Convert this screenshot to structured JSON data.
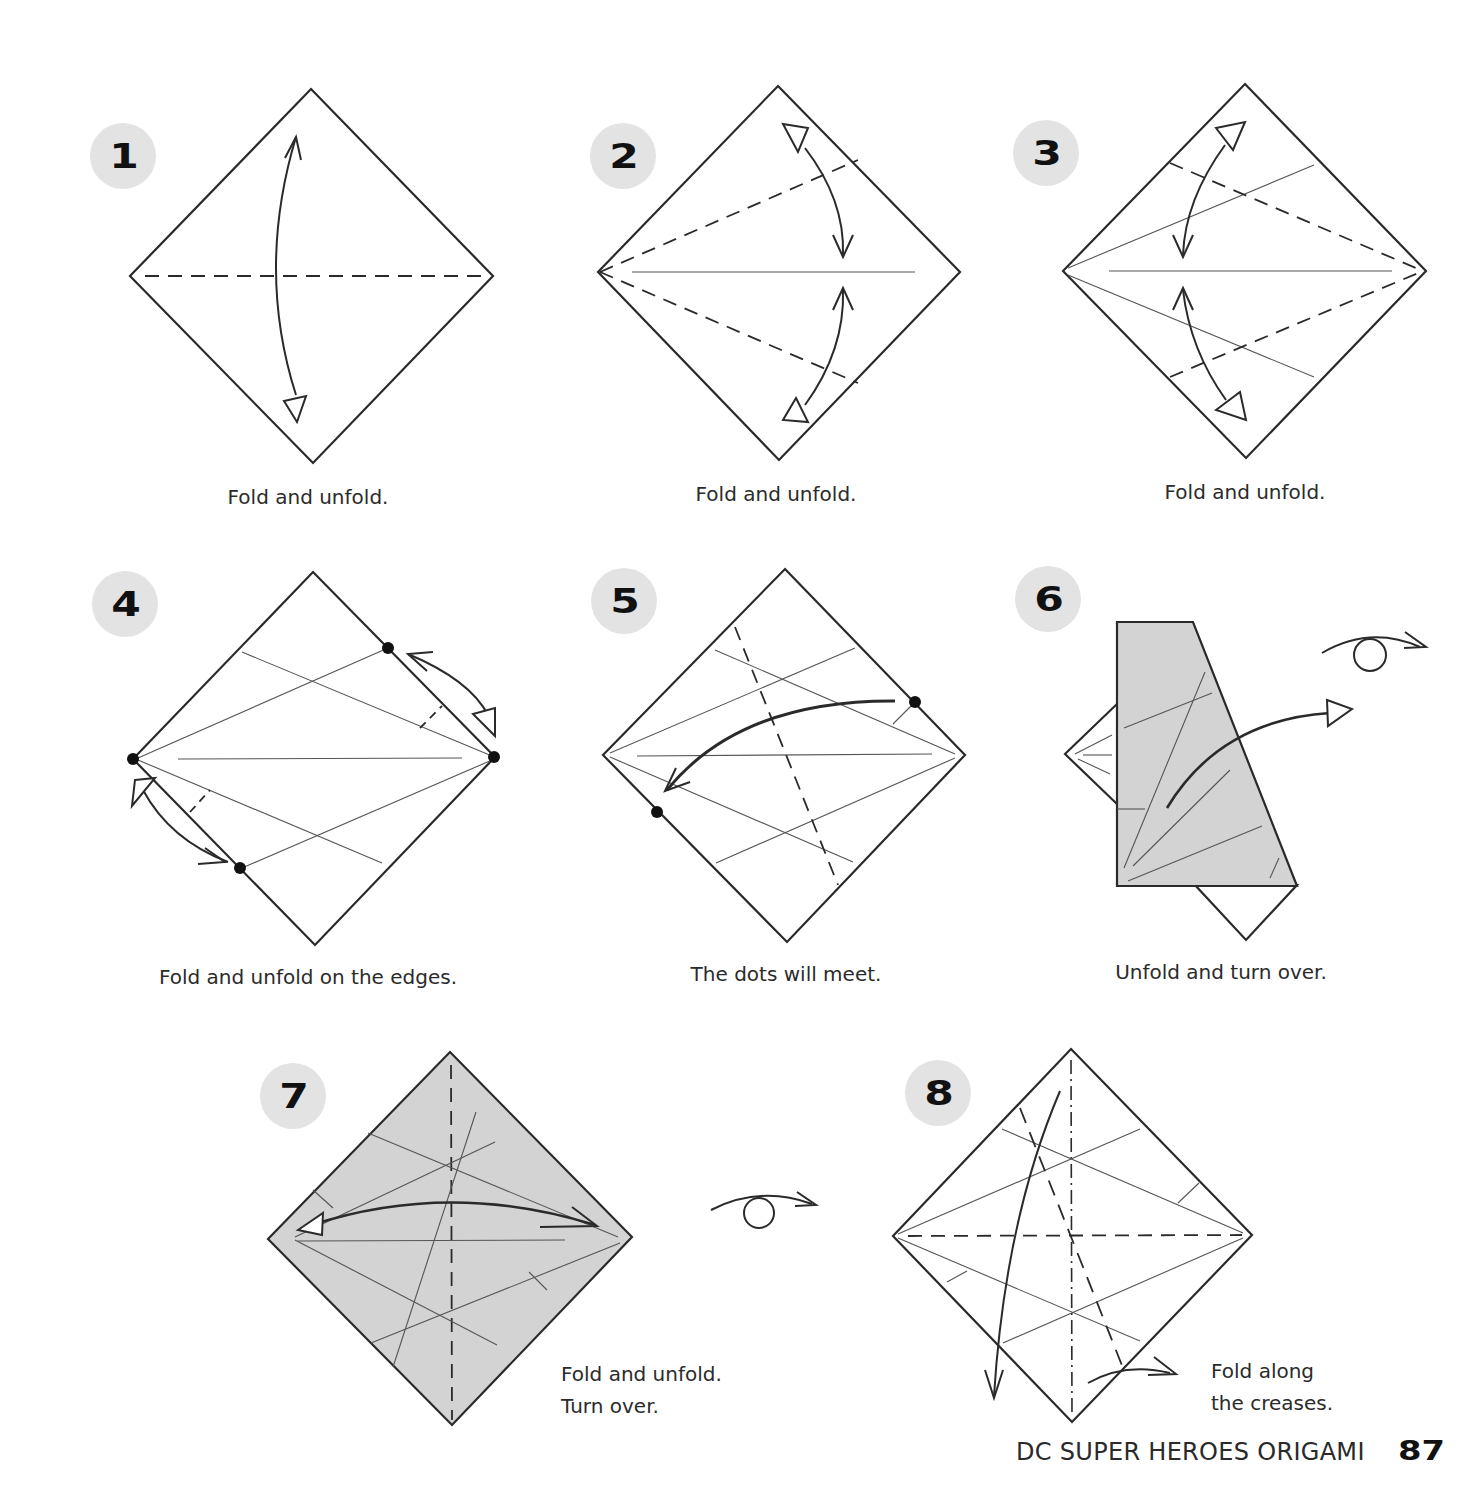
{
  "page": {
    "book_title": "DC SUPER HEROES ORIGAMI",
    "page_number": "87"
  },
  "steps": [
    {
      "number": "1",
      "caption": "Fold and unfold."
    },
    {
      "number": "2",
      "caption": "Fold and unfold."
    },
    {
      "number": "3",
      "caption": "Fold and unfold."
    },
    {
      "number": "4",
      "caption": "Fold and unfold on the edges."
    },
    {
      "number": "5",
      "caption": "The dots will meet."
    },
    {
      "number": "6",
      "caption": "Unfold and turn over."
    },
    {
      "number": "7",
      "caption_line1": "Fold and unfold.",
      "caption_line2": "Turn over."
    },
    {
      "number": "8",
      "caption_line1": "Fold along",
      "caption_line2": "the creases."
    }
  ],
  "icons": {
    "turn_over": "turn-over-icon",
    "fold_arrow": "fold-arrow-icon",
    "valley_fold": "dashed-line",
    "mountain_fold": "dash-dot-line"
  },
  "colors": {
    "badge_bg": "#e3e3e3",
    "paper_colored": "#d3d3d3",
    "line": "#2a2a2a",
    "crease": "#555555"
  }
}
